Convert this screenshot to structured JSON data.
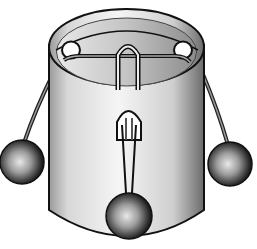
{
  "figure": {
    "background": "#ffffff",
    "colors": {
      "outline": "#111111",
      "cylinder_light": "#f2f2f2",
      "cylinder_dark": "#8a8a8a",
      "inner_rim": "#bdbdbd",
      "string": "#555555",
      "ball_light": "#e6e6e6",
      "ball_dark": "#1a1a1a"
    },
    "parts": {
      "cylinder": "cylinder",
      "holes": [
        "left-hole",
        "right-hole",
        "front-slot"
      ],
      "strings": [
        "left-string",
        "right-string",
        "loop-string"
      ],
      "balls": [
        "left-ball",
        "right-ball",
        "front-ball"
      ]
    }
  }
}
